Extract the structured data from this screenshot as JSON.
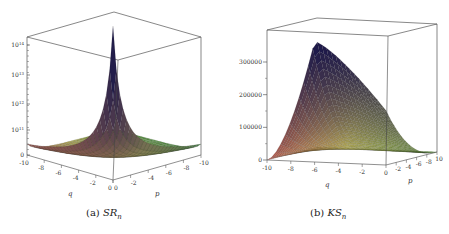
{
  "chart_data": [
    {
      "type": "surface3d",
      "panel_label": "(a)",
      "title_symbol": "SR",
      "title_subscript": "n",
      "xlabel": "q",
      "ylabel": "p",
      "zscale": "log",
      "x_range": [
        -10,
        0
      ],
      "y_range": [
        0,
        -10
      ],
      "x_ticks": [
        "-10",
        "-8",
        "-6",
        "-4",
        "-2",
        "0"
      ],
      "y_ticks": [
        "0",
        "-2",
        "-4",
        "-6",
        "-8",
        "-10"
      ],
      "z_ticks": [
        "0",
        "10^11",
        "10^12",
        "10^13",
        "10^14"
      ],
      "z_tick_labels": [
        {
          "base": "0",
          "exp": ""
        },
        {
          "base": "10",
          "exp": "11"
        },
        {
          "base": "10",
          "exp": "12"
        },
        {
          "base": "10",
          "exp": "13"
        },
        {
          "base": "10",
          "exp": "14"
        }
      ],
      "colormap": [
        "#c0504d",
        "#c9c05a",
        "#5fa64a",
        "#1e1a4a"
      ],
      "description": "Surface with sharp peak at (q,p)=(0,0) decaying toward edges; near zero along far edges"
    },
    {
      "type": "surface3d",
      "panel_label": "(b)",
      "title_symbol": "KS",
      "title_subscript": "n",
      "xlabel": "q",
      "ylabel": "p",
      "zscale": "linear",
      "x_range": [
        -10,
        0
      ],
      "y_range": [
        0,
        -10
      ],
      "x_ticks": [
        "-10",
        "-8",
        "-6",
        "-4",
        "-2",
        "0"
      ],
      "y_ticks": [
        "-2",
        "-4",
        "-6",
        "-8",
        "10"
      ],
      "z_ticks": [
        "0",
        "100000",
        "200000",
        "300000"
      ],
      "z_range": [
        0,
        370000
      ],
      "peak_value": 370000,
      "colormap": [
        "#c0504d",
        "#c9c05a",
        "#5fa64a",
        "#1e1a4a"
      ],
      "description": "Surface rising from zero at q=-10 and p=-10 edges to peak near (q,p)=(-6,0)"
    }
  ],
  "captions": {
    "a": {
      "label": "(a)",
      "symbol": "SR",
      "sub": "n"
    },
    "b": {
      "label": "(b)",
      "symbol": "KS",
      "sub": "n"
    }
  }
}
